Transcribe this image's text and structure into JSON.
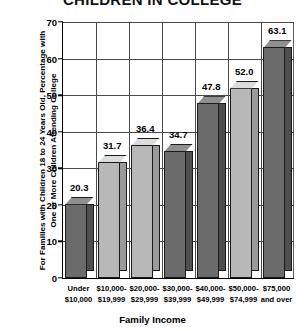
{
  "chart_data": {
    "type": "bar",
    "title": "CHILDREN IN COLLEGE",
    "xlabel": "Family Income",
    "ylabel": "For Families with Children 18 to 24 Years Old, Percentage with One or More Children Attending College",
    "categories": [
      "Under $10,000",
      "$10,000-$19,999",
      "$20,000-$29,999",
      "$30,000-$39,999",
      "$40,000-$49,999",
      "$50,000-$74,999",
      "$75,000 and over"
    ],
    "category_lines": [
      [
        "Under",
        "$10,000"
      ],
      [
        "$10,000-",
        "$19,999"
      ],
      [
        "$20,000-",
        "$29,999"
      ],
      [
        "$30,000-",
        "$39,999"
      ],
      [
        "$40,000-",
        "$49,999"
      ],
      [
        "$50,000-",
        "$74,999"
      ],
      [
        "$75,000",
        "and over"
      ]
    ],
    "values": [
      20.3,
      31.7,
      36.4,
      34.7,
      47.8,
      52.0,
      63.1
    ],
    "value_labels": [
      "20.3",
      "31.7",
      "36.4",
      "34.7",
      "47.8",
      "52.0",
      "63.1"
    ],
    "bar_shades": [
      "dark",
      "light",
      "light",
      "dark",
      "dark",
      "light",
      "dark"
    ],
    "ylim": [
      0,
      70
    ],
    "yticks": [
      0,
      10,
      20,
      30,
      40,
      50,
      60,
      70
    ],
    "ytick_labels": [
      "0",
      "10",
      "20",
      "30",
      "40",
      "50",
      "60",
      "70"
    ],
    "grid": true,
    "legend": "none",
    "colors": {
      "bar_dark_front": "#6b6b6b",
      "bar_dark_top": "#8f8f8f",
      "bar_dark_side": "#4e4e4e",
      "bar_light_front": "#b8b8b8",
      "bar_light_top": "#dcdcdc",
      "bar_light_side": "#9a9a9a",
      "axis": "#000000",
      "grid": "#4a4a4a",
      "background": "#ffffff"
    }
  }
}
